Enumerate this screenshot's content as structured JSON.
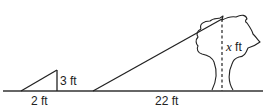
{
  "diagram": {
    "type": "similar-triangles-shadow",
    "small_triangle": {
      "height_label": "3 ft",
      "base_label": "2 ft"
    },
    "tree": {
      "height_label_var": "x",
      "height_label_unit": " ft",
      "shadow_label": "22 ft"
    },
    "colors": {
      "stroke": "#222222",
      "background": "#ffffff"
    }
  }
}
